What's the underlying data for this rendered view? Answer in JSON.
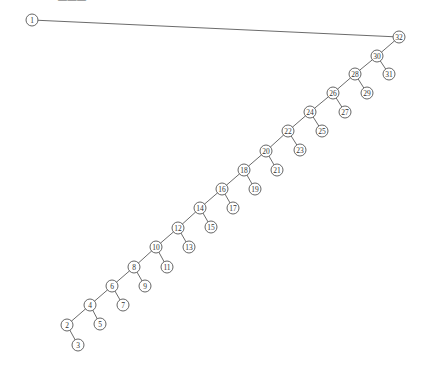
{
  "caption": "———",
  "style": {
    "edge_color": "#5a5a5a",
    "node_stroke": "#555555",
    "node_fill": "#ffffff",
    "node_radius": 6
  },
  "tree": {
    "nodes": [
      {
        "id": 1,
        "label": "1",
        "x": 32,
        "y": 20
      },
      {
        "id": 32,
        "label": "32",
        "x": 399,
        "y": 37
      },
      {
        "id": 30,
        "label": "30",
        "x": 377,
        "y": 56
      },
      {
        "id": 31,
        "label": "31",
        "x": 389,
        "y": 74
      },
      {
        "id": 28,
        "label": "28",
        "x": 355,
        "y": 74
      },
      {
        "id": 29,
        "label": "29",
        "x": 367,
        "y": 93
      },
      {
        "id": 26,
        "label": "26",
        "x": 333,
        "y": 93
      },
      {
        "id": 27,
        "label": "27",
        "x": 345,
        "y": 112
      },
      {
        "id": 24,
        "label": "24",
        "x": 310,
        "y": 112
      },
      {
        "id": 25,
        "label": "25",
        "x": 322,
        "y": 131
      },
      {
        "id": 22,
        "label": "22",
        "x": 288,
        "y": 131
      },
      {
        "id": 23,
        "label": "23",
        "x": 300,
        "y": 150
      },
      {
        "id": 20,
        "label": "20",
        "x": 266,
        "y": 151
      },
      {
        "id": 21,
        "label": "21",
        "x": 277,
        "y": 170
      },
      {
        "id": 18,
        "label": "18",
        "x": 244,
        "y": 170
      },
      {
        "id": 19,
        "label": "19",
        "x": 255,
        "y": 189
      },
      {
        "id": 16,
        "label": "16",
        "x": 222,
        "y": 189
      },
      {
        "id": 17,
        "label": "17",
        "x": 233,
        "y": 208
      },
      {
        "id": 14,
        "label": "14",
        "x": 200,
        "y": 208
      },
      {
        "id": 15,
        "label": "15",
        "x": 211,
        "y": 227
      },
      {
        "id": 12,
        "label": "12",
        "x": 178,
        "y": 228
      },
      {
        "id": 13,
        "label": "13",
        "x": 189,
        "y": 247
      },
      {
        "id": 10,
        "label": "10",
        "x": 156,
        "y": 247
      },
      {
        "id": 11,
        "label": "11",
        "x": 167,
        "y": 267
      },
      {
        "id": 8,
        "label": "8",
        "x": 134,
        "y": 267
      },
      {
        "id": 9,
        "label": "9",
        "x": 145,
        "y": 286
      },
      {
        "id": 6,
        "label": "6",
        "x": 112,
        "y": 286
      },
      {
        "id": 7,
        "label": "7",
        "x": 123,
        "y": 305
      },
      {
        "id": 4,
        "label": "4",
        "x": 90,
        "y": 305
      },
      {
        "id": 5,
        "label": "5",
        "x": 100,
        "y": 324
      },
      {
        "id": 2,
        "label": "2",
        "x": 67,
        "y": 325
      },
      {
        "id": 3,
        "label": "3",
        "x": 78,
        "y": 345
      }
    ],
    "edges": [
      [
        1,
        32
      ],
      [
        32,
        30
      ],
      [
        30,
        31
      ],
      [
        30,
        28
      ],
      [
        28,
        29
      ],
      [
        28,
        26
      ],
      [
        26,
        27
      ],
      [
        26,
        24
      ],
      [
        24,
        25
      ],
      [
        24,
        22
      ],
      [
        22,
        23
      ],
      [
        22,
        20
      ],
      [
        20,
        21
      ],
      [
        20,
        18
      ],
      [
        18,
        19
      ],
      [
        18,
        16
      ],
      [
        16,
        17
      ],
      [
        16,
        14
      ],
      [
        14,
        15
      ],
      [
        14,
        12
      ],
      [
        12,
        13
      ],
      [
        12,
        10
      ],
      [
        10,
        11
      ],
      [
        10,
        8
      ],
      [
        8,
        9
      ],
      [
        8,
        6
      ],
      [
        6,
        7
      ],
      [
        6,
        4
      ],
      [
        4,
        5
      ],
      [
        4,
        2
      ],
      [
        2,
        3
      ]
    ]
  }
}
